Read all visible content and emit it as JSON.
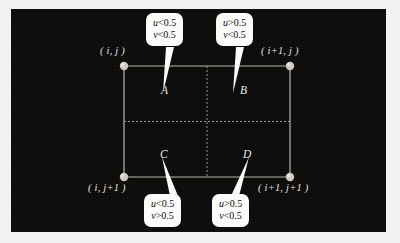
{
  "figure": {
    "background_color": "#0c0b0a",
    "page_color": "#f2f1ef",
    "line_color": "#b9b6ae",
    "node_color": "#cfcbc2",
    "callout_fill": "#fbfbfa",
    "callout_text_color": "#111010"
  },
  "grid": {
    "corner_labels": [
      {
        "id": "top-left",
        "text": "( i,  j )"
      },
      {
        "id": "top-right",
        "text": "( i+1,  j )"
      },
      {
        "id": "bottom-left",
        "text": "( i,  j+1 )"
      },
      {
        "id": "bottom-right",
        "text": "( i+1,  j+1 )"
      }
    ],
    "quadrants": [
      {
        "id": "A",
        "label": "A"
      },
      {
        "id": "B",
        "label": "B"
      },
      {
        "id": "C",
        "label": "C"
      },
      {
        "id": "D",
        "label": "D"
      }
    ]
  },
  "callouts": [
    {
      "id": "callout-a",
      "target": "A",
      "line1": "u<0.5",
      "line2": "v<0.5",
      "var1": "u",
      "var2": "v",
      "cond1": "<0.5",
      "cond2": "<0.5"
    },
    {
      "id": "callout-b",
      "target": "B",
      "line1": "u>0.5",
      "line2": "v<0.5",
      "var1": "u",
      "var2": "v",
      "cond1": ">0.5",
      "cond2": "<0.5"
    },
    {
      "id": "callout-c",
      "target": "C",
      "line1": "u<0.5",
      "line2": "v>0.5",
      "var1": "u",
      "var2": "v",
      "cond1": "<0.5",
      "cond2": ">0.5"
    },
    {
      "id": "callout-d",
      "target": "D",
      "line1": "u>0.5",
      "line2": "v<0.5",
      "var1": "u",
      "var2": "v",
      "cond1": ">0.5",
      "cond2": "<0.5"
    }
  ]
}
